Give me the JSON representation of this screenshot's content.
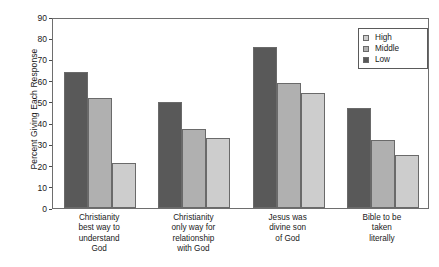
{
  "chart_data": {
    "type": "bar",
    "title": "",
    "xlabel": "",
    "ylabel": "Percent Giving Each Response",
    "ylim": [
      0,
      90
    ],
    "ytick_step": 10,
    "yticks": [
      0,
      10,
      20,
      30,
      40,
      50,
      60,
      70,
      80,
      90
    ],
    "grid": false,
    "legend_position": "top-right",
    "categories": [
      "Christianity best way to understand God",
      "Christianity only way for relationship with God",
      "Jesus was divine son of God",
      "Bible to be taken literally"
    ],
    "category_lines": [
      [
        "Christianity",
        "best way to",
        "understand",
        "God"
      ],
      [
        "Christianity",
        "only way for",
        "relationship",
        "with God"
      ],
      [
        "Jesus was",
        "divine son",
        "of God"
      ],
      [
        "Bible to be",
        "taken",
        "literally"
      ]
    ],
    "series": [
      {
        "name": "Low",
        "color": "#595959",
        "values": [
          64,
          50,
          76,
          47
        ]
      },
      {
        "name": "Middle",
        "color": "#b0b0b0",
        "values": [
          52,
          37,
          59,
          32
        ]
      },
      {
        "name": "High",
        "color": "#cdcdcd",
        "values": [
          21,
          33,
          54,
          25
        ]
      }
    ],
    "legend_order": [
      "High",
      "Middle",
      "Low"
    ]
  },
  "colors": {
    "low": "#595959",
    "middle": "#b0b0b0",
    "high": "#cdcdcd",
    "frame": "#6e6e6e",
    "bar_edge": "#6a6a6a"
  }
}
